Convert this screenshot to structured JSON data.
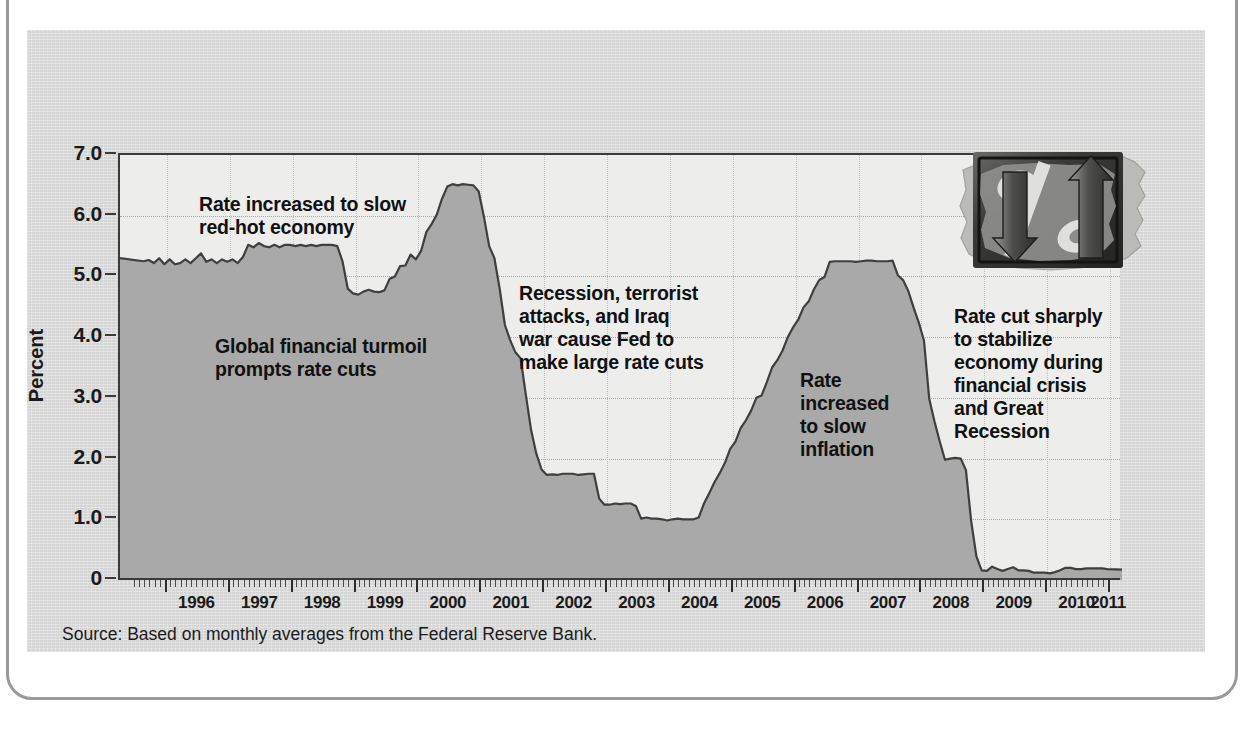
{
  "figure": {
    "source_note": "Source: Based on monthly averages from the Federal Reserve Bank.",
    "logo_name": "percent-sign-us-map-logo",
    "colors": {
      "panel_bg": "#d5d5d5",
      "plot_bg": "#ededec",
      "area_fill": "#a9a9a9",
      "area_line": "#3f3f3f",
      "axis": "#3a3a3a",
      "text": "#1b1b1b",
      "grid": "#a7a7a7"
    }
  },
  "chart_data": {
    "type": "area",
    "title": "",
    "subtitle": "",
    "xlabel": "",
    "ylabel": "Percent",
    "ylim": [
      0,
      7.0
    ],
    "xlim": [
      "1995-07",
      "2011-01"
    ],
    "grid": true,
    "legend": null,
    "y_ticks": [
      "0",
      "1.0",
      "2.0",
      "3.0",
      "4.0",
      "5.0",
      "6.0",
      "7.0"
    ],
    "y_tick_values": [
      0,
      1.0,
      2.0,
      3.0,
      4.0,
      5.0,
      6.0,
      7.0
    ],
    "x_ticks": [
      "1996",
      "1997",
      "1998",
      "1999",
      "2000",
      "2001",
      "2002",
      "2003",
      "2004",
      "2005",
      "2006",
      "2007",
      "2008",
      "2009",
      "2010",
      "2011"
    ],
    "x_tick_values": [
      1996,
      1997,
      1998,
      1999,
      2000,
      2001,
      2002,
      2003,
      2004,
      2005,
      2006,
      2007,
      2008,
      2009,
      2010,
      2011
    ],
    "minor_ticks": "monthly",
    "series": [
      {
        "name": "Federal funds rate",
        "units": "percent",
        "x": [
          "1995-07",
          "1995-08",
          "1995-09",
          "1995-10",
          "1995-11",
          "1995-12",
          "1996-01",
          "1996-02",
          "1996-03",
          "1996-04",
          "1996-05",
          "1996-06",
          "1996-07",
          "1996-08",
          "1996-09",
          "1996-10",
          "1996-11",
          "1996-12",
          "1997-01",
          "1997-02",
          "1997-03",
          "1997-04",
          "1997-05",
          "1997-06",
          "1997-07",
          "1997-08",
          "1997-09",
          "1997-10",
          "1997-11",
          "1997-12",
          "1998-01",
          "1998-02",
          "1998-03",
          "1998-04",
          "1998-05",
          "1998-06",
          "1998-07",
          "1998-08",
          "1998-09",
          "1998-10",
          "1998-11",
          "1998-12",
          "1999-01",
          "1999-02",
          "1999-03",
          "1999-04",
          "1999-05",
          "1999-06",
          "1999-07",
          "1999-08",
          "1999-09",
          "1999-10",
          "1999-11",
          "1999-12",
          "2000-01",
          "2000-02",
          "2000-03",
          "2000-04",
          "2000-05",
          "2000-06",
          "2000-07",
          "2000-08",
          "2000-09",
          "2000-10",
          "2000-11",
          "2000-12",
          "2001-01",
          "2001-02",
          "2001-03",
          "2001-04",
          "2001-05",
          "2001-06",
          "2001-07",
          "2001-08",
          "2001-09",
          "2001-10",
          "2001-11",
          "2001-12",
          "2002-01",
          "2002-02",
          "2002-03",
          "2002-04",
          "2002-05",
          "2002-06",
          "2002-07",
          "2002-08",
          "2002-09",
          "2002-10",
          "2002-11",
          "2002-12",
          "2003-01",
          "2003-02",
          "2003-03",
          "2003-04",
          "2003-05",
          "2003-06",
          "2003-07",
          "2003-08",
          "2003-09",
          "2003-10",
          "2003-11",
          "2003-12",
          "2004-01",
          "2004-02",
          "2004-03",
          "2004-04",
          "2004-05",
          "2004-06",
          "2004-07",
          "2004-08",
          "2004-09",
          "2004-10",
          "2004-11",
          "2004-12",
          "2005-01",
          "2005-02",
          "2005-03",
          "2005-04",
          "2005-05",
          "2005-06",
          "2005-07",
          "2005-08",
          "2005-09",
          "2005-10",
          "2005-11",
          "2005-12",
          "2006-01",
          "2006-02",
          "2006-03",
          "2006-04",
          "2006-05",
          "2006-06",
          "2006-07",
          "2006-08",
          "2006-09",
          "2006-10",
          "2006-11",
          "2006-12",
          "2007-01",
          "2007-02",
          "2007-03",
          "2007-04",
          "2007-05",
          "2007-06",
          "2007-07",
          "2007-08",
          "2007-09",
          "2007-10",
          "2007-11",
          "2007-12",
          "2008-01",
          "2008-02",
          "2008-03",
          "2008-04",
          "2008-05",
          "2008-06",
          "2008-07",
          "2008-08",
          "2008-09",
          "2008-10",
          "2008-11",
          "2008-12",
          "2009-01",
          "2009-02",
          "2009-03",
          "2009-04",
          "2009-05",
          "2009-06",
          "2009-07",
          "2009-08",
          "2009-09",
          "2009-10",
          "2009-11",
          "2009-12",
          "2010-01",
          "2010-02",
          "2010-03",
          "2010-04",
          "2010-05",
          "2010-06",
          "2010-07",
          "2010-08",
          "2010-09",
          "2010-10",
          "2010-11",
          "2010-12",
          "2011-01"
        ],
        "values": [
          5.3,
          5.25,
          5.27,
          5.22,
          5.3,
          5.2,
          5.28,
          5.2,
          5.22,
          5.28,
          5.22,
          5.3,
          5.38,
          5.24,
          5.28,
          5.22,
          5.28,
          5.24,
          5.28,
          5.22,
          5.32,
          5.52,
          5.48,
          5.55,
          5.5,
          5.48,
          5.52,
          5.48,
          5.52,
          5.52,
          5.5,
          5.52,
          5.5,
          5.52,
          5.5,
          5.52,
          5.52,
          5.52,
          5.5,
          5.25,
          4.8,
          4.72,
          4.7,
          4.75,
          4.78,
          4.75,
          4.74,
          4.77,
          4.96,
          5.0,
          5.17,
          5.18,
          5.36,
          5.28,
          5.42,
          5.73,
          5.86,
          6.02,
          6.28,
          6.48,
          6.52,
          6.5,
          6.52,
          6.51,
          6.5,
          6.4,
          5.98,
          5.5,
          5.3,
          4.8,
          4.2,
          3.95,
          3.75,
          3.65,
          3.05,
          2.47,
          2.08,
          1.82,
          1.73,
          1.74,
          1.73,
          1.75,
          1.75,
          1.75,
          1.73,
          1.74,
          1.75,
          1.75,
          1.34,
          1.24,
          1.24,
          1.26,
          1.25,
          1.26,
          1.26,
          1.22,
          1.01,
          1.03,
          1.01,
          1.01,
          1.0,
          0.98,
          1.0,
          1.01,
          1.0,
          1.0,
          1.0,
          1.03,
          1.26,
          1.43,
          1.61,
          1.76,
          1.93,
          2.16,
          2.28,
          2.5,
          2.63,
          2.79,
          3.0,
          3.04,
          3.26,
          3.5,
          3.62,
          3.78,
          4.0,
          4.16,
          4.29,
          4.49,
          4.59,
          4.79,
          4.94,
          4.99,
          5.24,
          5.25,
          5.25,
          5.25,
          5.25,
          5.24,
          5.25,
          5.26,
          5.26,
          5.25,
          5.25,
          5.25,
          5.26,
          5.02,
          4.94,
          4.76,
          4.49,
          4.24,
          3.94,
          2.98,
          2.61,
          2.28,
          1.98,
          2.0,
          2.01,
          2.0,
          1.81,
          0.97,
          0.39,
          0.16,
          0.15,
          0.22,
          0.18,
          0.15,
          0.18,
          0.21,
          0.16,
          0.16,
          0.15,
          0.12,
          0.12,
          0.12,
          0.11,
          0.13,
          0.16,
          0.2,
          0.2,
          0.18,
          0.18,
          0.19,
          0.19,
          0.19,
          0.19,
          0.18,
          0.17
        ]
      }
    ],
    "annotations": [
      {
        "id": "ann-0",
        "text": "Rate increased to slow\nred-hot economy",
        "anchor_year": 1996.3,
        "anchor_value": 6.75
      },
      {
        "id": "ann-1",
        "text": "Global financial turmoil\nprompts rate cuts",
        "anchor_year": 1996.6,
        "anchor_value": 4.4
      },
      {
        "id": "ann-2",
        "text": "Recession, terrorist\nattacks, and Iraq\nwar cause Fed to\nmake large rate cuts",
        "anchor_year": 2001.4,
        "anchor_value": 5.3
      },
      {
        "id": "ann-3",
        "text": "Rate\nincreased\nto slow\ninflation",
        "anchor_year": 2005.7,
        "anchor_value": 3.7
      },
      {
        "id": "ann-4",
        "text": "Rate cut sharply\nto stabilize\neconomy during\nfinancial crisis\nand Great\nRecession",
        "anchor_year": 2008.2,
        "anchor_value": 4.8
      }
    ]
  }
}
